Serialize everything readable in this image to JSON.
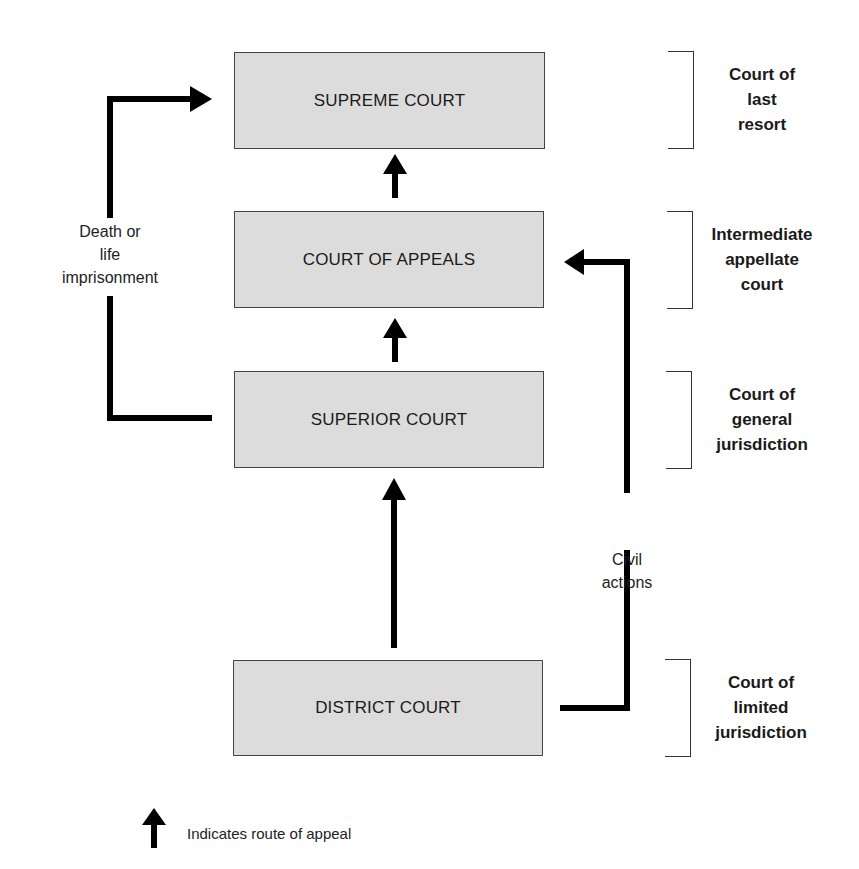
{
  "courts": [
    {
      "id": "supreme",
      "label": "SUPREME COURT"
    },
    {
      "id": "appeals",
      "label": "COURT OF APPEALS"
    },
    {
      "id": "superior",
      "label": "SUPERIOR COURT"
    },
    {
      "id": "district",
      "label": "DISTRICT COURT"
    }
  ],
  "tiers": [
    {
      "label": "Court of last resort"
    },
    {
      "label": "Intermediate appellate court"
    },
    {
      "label": "Court of general jurisdiction"
    },
    {
      "label": "Court of limited jurisdiction"
    }
  ],
  "tier_lines": [
    [
      "Court of",
      "last",
      "resort"
    ],
    [
      "Intermediate",
      "appellate",
      "court"
    ],
    [
      "Court of",
      "general",
      "jurisdiction"
    ],
    [
      "Court of",
      "limited",
      "jurisdiction"
    ]
  ],
  "annotations": {
    "death_or_life": [
      "Death or",
      "life",
      "imprisonment"
    ],
    "civil_actions": [
      "Civil",
      "actions"
    ]
  },
  "legend": {
    "icon": "up-arrow-icon",
    "text": "Indicates route of appeal"
  },
  "colors": {
    "box_fill": "#dcdcdc",
    "arrow": "#000000"
  }
}
